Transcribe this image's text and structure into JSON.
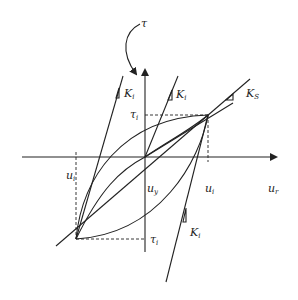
{
  "diagram": {
    "title_symbol": "τ",
    "axes": {
      "horizontal_label": "u",
      "horizontal_label_sub": "r",
      "origin_label": "u",
      "origin_label_sub": "y"
    },
    "labels": {
      "ui_left": "u",
      "ui_left_sub": "i",
      "ui_right": "u",
      "ui_right_sub": "i",
      "tau_top": "τ",
      "tau_top_sub": "i",
      "tau_bottom": "τ",
      "tau_bottom_sub": "i",
      "k_left": "K",
      "k_left_sub": "i",
      "k_mid": "K",
      "k_mid_sub": "i",
      "k_secant": "K",
      "k_secant_sub": "S",
      "k_bottom": "K",
      "k_bottom_sub": "i"
    },
    "points": {
      "origin": [
        145,
        157
      ],
      "upper_reversal": [
        208,
        115
      ],
      "lower_reversal": [
        76,
        239
      ]
    },
    "colors": {
      "stroke": "#222222",
      "background": "#ffffff"
    }
  }
}
